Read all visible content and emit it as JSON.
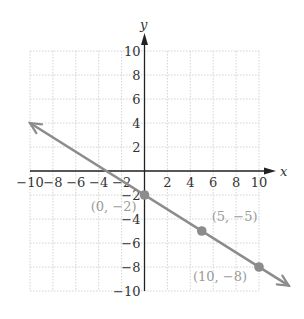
{
  "chart_data": {
    "type": "line",
    "title": "",
    "xlabel": "x",
    "ylabel": "y",
    "xlim": [
      -10,
      10
    ],
    "ylim": [
      -10,
      10
    ],
    "grid": true,
    "x_ticks": [
      -10,
      -8,
      -6,
      -4,
      -2,
      2,
      4,
      6,
      8,
      10
    ],
    "y_ticks": [
      10,
      8,
      6,
      4,
      2,
      -2,
      -4,
      -6,
      -8,
      -10
    ],
    "x_tick_labels": [
      "−10",
      "−8",
      "−6",
      "−4",
      "−2",
      "2",
      "4",
      "6",
      "8",
      "10"
    ],
    "y_tick_labels": [
      "10",
      "8",
      "6",
      "4",
      "2",
      "−2",
      "−4",
      "−6",
      "−8",
      "−10"
    ],
    "series": [
      {
        "name": "y = -3/5 x - 2",
        "slope": -0.6,
        "intercept": -2,
        "x": [
          -10,
          12.6
        ],
        "y": [
          4,
          -9.56
        ],
        "arrows": "both",
        "color": "#8c8c8c"
      }
    ],
    "points": [
      {
        "x": 0,
        "y": -2,
        "label": "(0, −2)"
      },
      {
        "x": 5,
        "y": -5,
        "label": "(5, −5)"
      },
      {
        "x": 10,
        "y": -8,
        "label": "(10, −8)"
      }
    ],
    "annotations": [
      "(0, −2)",
      "(5, −5)",
      "(10, −8)"
    ]
  },
  "colors": {
    "line": "#8c8c8c",
    "point": "#8c8c8c",
    "axis": "#222222",
    "grid": "#c8c8c8",
    "point_label": "#9a9a9a"
  }
}
